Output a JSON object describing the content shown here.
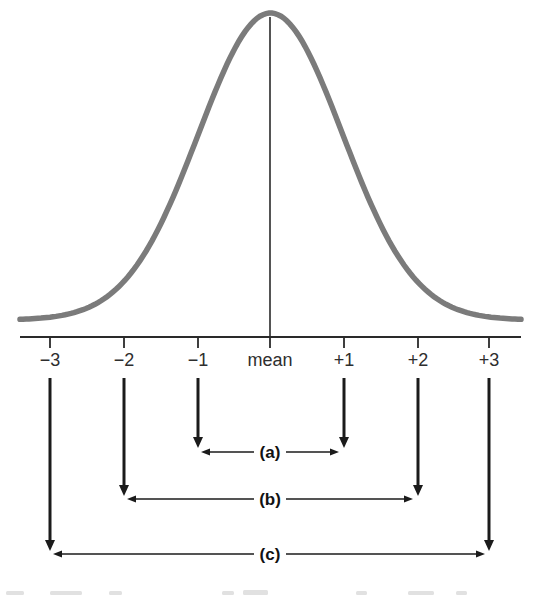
{
  "figure": {
    "colors": {
      "curve": "#7b7b7b",
      "axis": "#2a2a2a",
      "arrow": "#1b1b1b",
      "label": "#2e2e2e"
    },
    "x_axis": {
      "tick_labels": [
        "−3",
        "−2",
        "−1",
        "mean",
        "+1",
        "+2",
        "+3"
      ]
    },
    "ranges": [
      {
        "label": "(a)",
        "from": "−1",
        "to": "+1"
      },
      {
        "label": "(b)",
        "from": "−2",
        "to": "+2"
      },
      {
        "label": "(c)",
        "from": "−3",
        "to": "+3"
      }
    ]
  },
  "chart_data": {
    "type": "line",
    "title": "",
    "xlabel": "",
    "ylabel": "",
    "x_tick_labels": [
      "−3",
      "−2",
      "−1",
      "mean",
      "+1",
      "+2",
      "+3"
    ],
    "series": [
      {
        "name": "normal-curve",
        "shape": "gaussian-bell",
        "center_label": "mean",
        "sd_units": [
          -3,
          -2,
          -1,
          0,
          1,
          2,
          3
        ]
      }
    ],
    "annotations": [
      {
        "label": "(a)",
        "span_sd": [
          -1,
          1
        ]
      },
      {
        "label": "(b)",
        "span_sd": [
          -2,
          2
        ]
      },
      {
        "label": "(c)",
        "span_sd": [
          -3,
          3
        ]
      }
    ],
    "legend": "none",
    "grid": false
  }
}
